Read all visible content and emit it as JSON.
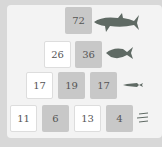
{
  "pyramid": {
    "rows": [
      [
        {
          "value": "72",
          "type": "given"
        }
      ],
      [
        {
          "value": "26",
          "type": "input"
        },
        {
          "value": "36",
          "type": "given"
        }
      ],
      [
        {
          "value": "17",
          "type": "input"
        },
        {
          "value": "19",
          "type": "given"
        },
        {
          "value": "17",
          "type": "given"
        }
      ],
      [
        {
          "value": "11",
          "type": "input"
        },
        {
          "value": "6",
          "type": "given"
        },
        {
          "value": "13",
          "type": "input"
        },
        {
          "value": "4",
          "type": "given"
        }
      ]
    ]
  },
  "icons": [
    "shark-icon",
    "fish-icon",
    "small-fish-icon",
    "tiny-fish-icon"
  ],
  "colors": {
    "given": "#c8c8c8",
    "input": "#ffffff",
    "panel": "#f3f3f3",
    "fish": "#5f6a64"
  }
}
